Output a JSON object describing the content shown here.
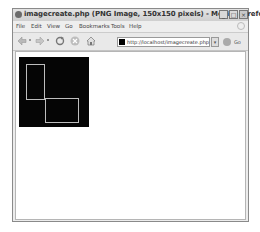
{
  "window": {
    "title": "imagecreate.php (PNG Image, 150x150 pixels) - Mozilla Firefox",
    "buttons": {
      "minimize": "_",
      "maximize": "□",
      "close": "×"
    }
  },
  "menubar": {
    "items": [
      {
        "label": "File"
      },
      {
        "label": "Edit"
      },
      {
        "label": "View"
      },
      {
        "label": "Go"
      },
      {
        "label": "Bookmarks"
      },
      {
        "label": "Tools"
      },
      {
        "label": "Help"
      }
    ]
  },
  "toolbar": {
    "back_icon": "back-arrow-icon",
    "forward_icon": "forward-arrow-icon",
    "reload_icon": "reload-icon",
    "stop_icon": "stop-icon",
    "home_icon": "home-icon",
    "url": "http://localhost/imagecreate.php",
    "go_label": "Go"
  },
  "content": {
    "image": {
      "width": 150,
      "height": 150,
      "background": "#000000",
      "rectangles": [
        {
          "x1": 15,
          "y1": 15,
          "x2": 55,
          "y2": 90,
          "color": "#c0c0c0"
        },
        {
          "x1": 55,
          "y1": 88,
          "x2": 128,
          "y2": 140,
          "color": "#c0c0c0"
        }
      ]
    }
  }
}
